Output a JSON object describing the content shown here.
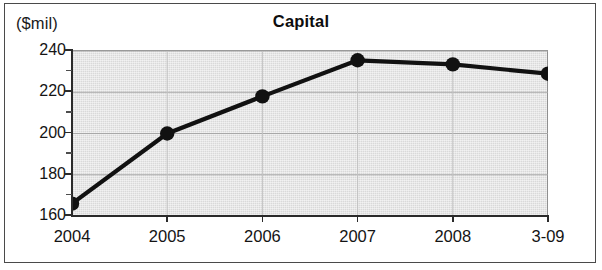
{
  "chart_data": {
    "type": "line",
    "title": "Capital",
    "xlabel": "",
    "ylabel": "($mil)",
    "unit_label": "($mil)",
    "categories": [
      "2004",
      "2005",
      "2006",
      "2007",
      "2008",
      "3-09"
    ],
    "values": [
      166,
      200,
      218,
      235.5,
      233.5,
      229
    ],
    "series": [
      {
        "name": "Capital",
        "values": [
          166,
          200,
          218,
          235.5,
          233.5,
          229
        ]
      }
    ],
    "ylim": [
      160,
      240
    ],
    "ytick_labels": [
      "240",
      "220",
      "200",
      "180",
      "160"
    ],
    "ytick_values": [
      240,
      220,
      200,
      180,
      160
    ],
    "yminor_tick_values": [
      230,
      210,
      190,
      170
    ],
    "xlim_categories": [
      "2004",
      "3-09"
    ],
    "grid": true,
    "grid_axis": "y",
    "legend": false,
    "legend_position": "none",
    "marker": "filled-circle",
    "line_color": "#111111",
    "marker_color": "#111111",
    "plot_background": "#d9d9d9",
    "figure_background": "#ffffff",
    "axis_color": "#2b2b2b",
    "text_color": "#141414"
  },
  "figure": {
    "title": "Capital",
    "unit_label": "($mil)"
  },
  "axes": {
    "y": {
      "labels": [
        "240",
        "220",
        "200",
        "180",
        "160"
      ]
    },
    "x": {
      "labels": [
        "2004",
        "2005",
        "2006",
        "2007",
        "2008",
        "3-09"
      ]
    }
  }
}
